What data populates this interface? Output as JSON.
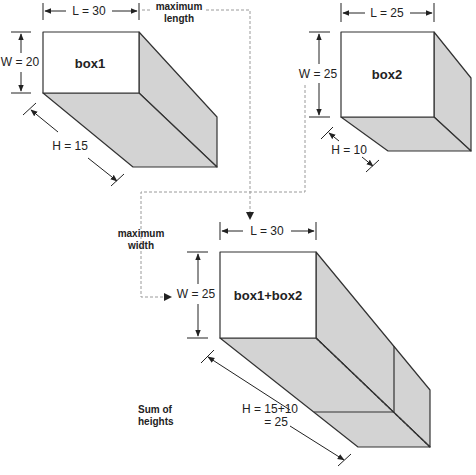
{
  "colors": {
    "face_front": "#ffffff",
    "face_shaded": "#d3d3d3",
    "stroke": "#333333",
    "dashed": "#9a9a9a"
  },
  "box1": {
    "name": "box1",
    "length_label": "L = 30",
    "width_label": "W = 20",
    "height_label": "H = 15"
  },
  "box2": {
    "name": "box2",
    "length_label": "L = 25",
    "width_label": "W = 25",
    "height_label": "H = 10"
  },
  "combined": {
    "name": "box1+box2",
    "length_label": "L = 30",
    "width_label": "W = 25",
    "height_label_line1": "H = 15+10",
    "height_label_line2": "= 25"
  },
  "annotations": {
    "max_length_line1": "maximum",
    "max_length_line2": "length",
    "max_width_line1": "maximum",
    "max_width_line2": "width",
    "sum_heights_line1": "Sum of",
    "sum_heights_line2": "heights"
  }
}
